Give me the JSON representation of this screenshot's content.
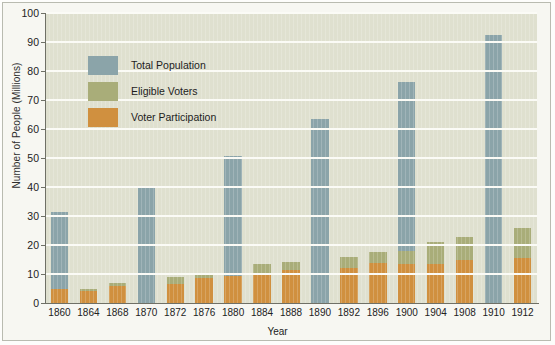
{
  "chart_data": {
    "type": "bar",
    "title": "",
    "xlabel": "Year",
    "ylabel": "Number of People (Millions)",
    "ylim": [
      0,
      100
    ],
    "yticks": [
      0,
      10,
      20,
      30,
      40,
      50,
      60,
      70,
      80,
      90,
      100
    ],
    "grid": true,
    "legend_position": "upper-left-inside",
    "categories": [
      "1860",
      "1864",
      "1868",
      "1870",
      "1872",
      "1876",
      "1880",
      "1884",
      "1888",
      "1890",
      "1892",
      "1896",
      "1900",
      "1904",
      "1908",
      "1910",
      "1912"
    ],
    "series": [
      {
        "name": "Total Population",
        "color": "#8ba4a9",
        "values": [
          31.5,
          null,
          null,
          40.0,
          null,
          null,
          50.8,
          null,
          null,
          63.5,
          null,
          null,
          76.3,
          null,
          null,
          92.5,
          null
        ]
      },
      {
        "name": "Eligible Voters",
        "color": "#a9ad79",
        "values": [
          null,
          5.0,
          6.8,
          null,
          8.8,
          9.8,
          null,
          13.4,
          14.2,
          null,
          16.0,
          17.6,
          null,
          21.0,
          22.8,
          null,
          25.8
        ]
      },
      {
        "name": "Voter Participation",
        "color": "#d0903f",
        "values": [
          4.7,
          4.2,
          5.9,
          null,
          6.6,
          8.5,
          9.2,
          10.3,
          11.4,
          null,
          12.2,
          13.8,
          null,
          13.6,
          14.9,
          null,
          15.4
        ]
      }
    ],
    "bars": [
      {
        "year": "1860",
        "total": 31.5,
        "eligible": null,
        "voter": 4.7
      },
      {
        "year": "1864",
        "total": null,
        "eligible": 5.0,
        "voter": 4.2
      },
      {
        "year": "1868",
        "total": null,
        "eligible": 6.8,
        "voter": 5.9
      },
      {
        "year": "1870",
        "total": 40.0,
        "eligible": null,
        "voter": null
      },
      {
        "year": "1872",
        "total": null,
        "eligible": 8.8,
        "voter": 6.6
      },
      {
        "year": "1876",
        "total": null,
        "eligible": 9.8,
        "voter": 8.5
      },
      {
        "year": "1880",
        "total": 50.8,
        "eligible": null,
        "voter": 9.2
      },
      {
        "year": "1884",
        "total": null,
        "eligible": 13.4,
        "voter": 10.3
      },
      {
        "year": "1888",
        "total": null,
        "eligible": 14.2,
        "voter": 11.4
      },
      {
        "year": "1890",
        "total": 63.5,
        "eligible": null,
        "voter": null
      },
      {
        "year": "1892",
        "total": null,
        "eligible": 16.0,
        "voter": 12.2
      },
      {
        "year": "1896",
        "total": null,
        "eligible": 17.6,
        "voter": 13.8
      },
      {
        "year": "1900",
        "total": 76.3,
        "eligible": 17.8,
        "voter": 13.6
      },
      {
        "year": "1904",
        "total": null,
        "eligible": 21.0,
        "voter": 13.6
      },
      {
        "year": "1908",
        "total": null,
        "eligible": 22.8,
        "voter": 14.9
      },
      {
        "year": "1910",
        "total": 92.5,
        "eligible": null,
        "voter": null
      },
      {
        "year": "1912",
        "total": null,
        "eligible": 25.8,
        "voter": 15.4
      }
    ]
  },
  "legend": {
    "items": [
      {
        "label": "Total Population",
        "color": "#8ba4a9"
      },
      {
        "label": "Eligible Voters",
        "color": "#a9ad79"
      },
      {
        "label": "Voter Participation",
        "color": "#d0903f"
      }
    ]
  },
  "axes": {
    "y_title": "Number of People (Millions)",
    "x_title": "Year"
  }
}
